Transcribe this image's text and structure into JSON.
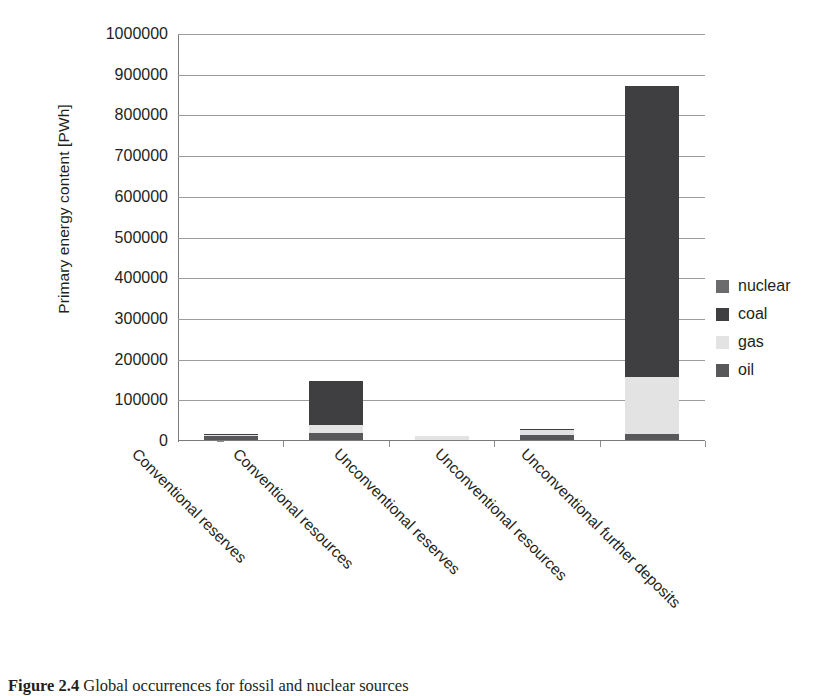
{
  "chart_data": {
    "type": "bar",
    "stacked": true,
    "title": "",
    "xlabel": "",
    "ylabel": "Primary energy content [PWh]",
    "ylim": [
      0,
      1000000
    ],
    "ytick_step": 100000,
    "yticks": [
      "1000000",
      "900000",
      "800000",
      "700000",
      "600000",
      "500000",
      "400000",
      "300000",
      "200000",
      "100000",
      "0"
    ],
    "grid": true,
    "legend_position": "right",
    "categories": [
      "Conventional reserves",
      "Conventional resources",
      "Unconventional reserves",
      "Unconventional resources",
      "Unconventional further deposits"
    ],
    "series": [
      {
        "name": "oil",
        "color": "#58585a",
        "values": [
          9000,
          18000,
          0,
          12000,
          14000
        ]
      },
      {
        "name": "gas",
        "color": "#e3e3e3",
        "values": [
          4000,
          20000,
          10000,
          15000,
          140000
        ]
      },
      {
        "name": "coal",
        "color": "#3f3f41",
        "values": [
          2000,
          107000,
          0,
          1000,
          716000
        ]
      },
      {
        "name": "nuclear",
        "color": "#6b6b6d",
        "values": [
          0,
          0,
          0,
          0,
          0
        ]
      }
    ],
    "totals": [
      15000,
      145000,
      10000,
      28000,
      870000
    ]
  },
  "legend": {
    "items": [
      {
        "label": "nuclear",
        "color": "#6b6b6d"
      },
      {
        "label": "coal",
        "color": "#3f3f41"
      },
      {
        "label": "gas",
        "color": "#e3e3e3"
      },
      {
        "label": "oil",
        "color": "#58585a"
      }
    ]
  },
  "caption": {
    "number": "Figure 2.4",
    "text": "Global occurrences for fossil and nuclear sources"
  },
  "colors": {
    "axis": "#7b7b7b",
    "grid": "#9c9c9c",
    "text": "#231f20",
    "background": "#ffffff"
  }
}
